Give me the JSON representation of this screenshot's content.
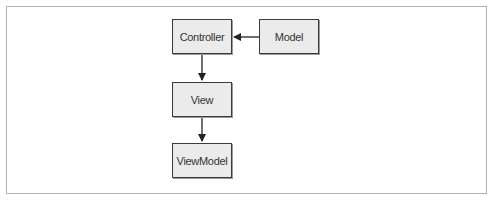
{
  "diagram": {
    "nodes": [
      {
        "id": "controller",
        "label": "Controller"
      },
      {
        "id": "model",
        "label": "Model"
      },
      {
        "id": "view",
        "label": "View"
      },
      {
        "id": "viewmodel",
        "label": "ViewModel"
      }
    ],
    "edges": [
      {
        "from": "model",
        "to": "controller"
      },
      {
        "from": "controller",
        "to": "view"
      },
      {
        "from": "view",
        "to": "viewmodel"
      }
    ],
    "colors": {
      "node_fill": "#ebebeb",
      "node_border": "#3a3a3a",
      "edge": "#222222",
      "frame": "#b0b0b0"
    }
  }
}
